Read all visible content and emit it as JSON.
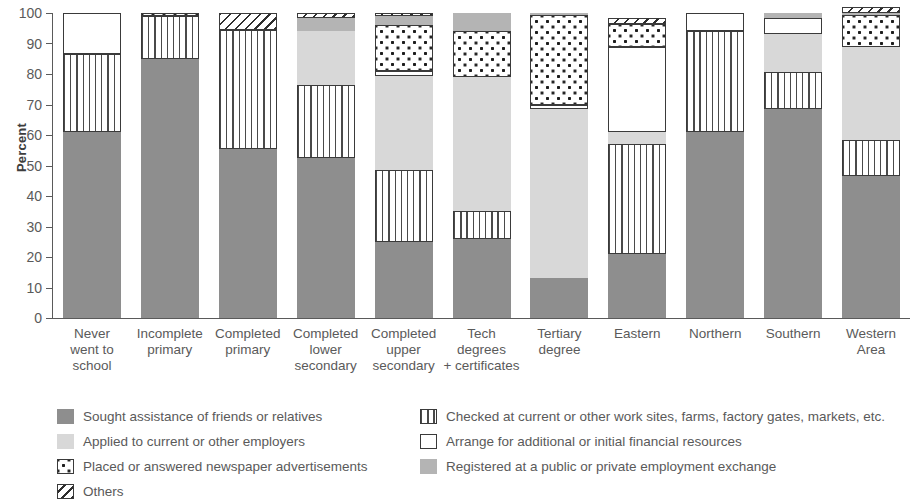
{
  "chart_data": {
    "type": "bar",
    "subtype": "stacked-bar-100",
    "title": "",
    "xlabel": "",
    "ylabel": "Percent",
    "ylim": [
      0,
      100
    ],
    "yticks": [
      0,
      10,
      20,
      30,
      40,
      50,
      60,
      70,
      80,
      90,
      100
    ],
    "grid": false,
    "legend_position": "bottom",
    "categories": [
      "Never\nwent to\nschool",
      "Incomplete\nprimary",
      "Completed\nprimary",
      "Completed\nlower\nsecondary",
      "Completed\nupper\nsecondary",
      "Tech\ndegrees\n+ certificates",
      "Tertiary\ndegree",
      "Eastern",
      "Northern",
      "Southern",
      "Western\nArea"
    ],
    "series": [
      {
        "name": "Sought assistance of friends or relatives",
        "key": "sought",
        "color": "#8e8e8e",
        "pattern": "solid-gray",
        "values": [
          61,
          85,
          55.5,
          52.5,
          25,
          26,
          13,
          21,
          61,
          68.5,
          46.5
        ]
      },
      {
        "name": "Checked at current or other work sites, farms, factory gates, markets, etc.",
        "key": "checked",
        "color": "#ffffff",
        "pattern": "vertical-stripes",
        "values": [
          25.5,
          14,
          39,
          24,
          23.5,
          9,
          0,
          36,
          33,
          12,
          12
        ]
      },
      {
        "name": "Applied to current or other employers",
        "key": "applied",
        "color": "#d8d8d8",
        "pattern": "light-gray",
        "values": [
          0,
          0,
          0,
          17.5,
          31,
          44,
          55.5,
          4,
          0,
          12.5,
          30.5
        ]
      },
      {
        "name": "Arrange for additional or initial financial resources",
        "key": "arrange",
        "color": "#ffffff",
        "pattern": "white",
        "values": [
          13.5,
          0,
          0,
          0,
          1.5,
          0,
          1.5,
          28,
          6,
          5.5,
          0
        ]
      },
      {
        "name": "Placed or answered newspaper advertisements",
        "key": "placed",
        "color": "#ffffff",
        "pattern": "dots",
        "values": [
          0,
          1,
          0,
          0,
          15,
          15,
          29.5,
          7.5,
          0,
          0,
          10.5
        ]
      },
      {
        "name": "Registered at a public or private employment exchange",
        "key": "registered",
        "color": "#b4b4b4",
        "pattern": "faint-gray",
        "values": [
          0,
          0,
          0,
          4.5,
          3,
          6,
          0.5,
          0,
          0,
          1.5,
          0.5
        ]
      },
      {
        "name": "Others",
        "key": "others",
        "color": "#ffffff",
        "pattern": "diagonal-hatch",
        "values": [
          0,
          0,
          5.5,
          1.5,
          1,
          0,
          0,
          2,
          0,
          0,
          2
        ]
      }
    ],
    "stack_order": [
      "sought",
      "checked",
      "applied",
      "arrange",
      "placed",
      "registered",
      "others"
    ]
  },
  "legend": {
    "left": [
      {
        "label": "Sought assistance of friends or relatives",
        "pattern": "solid-gray"
      },
      {
        "label": "Applied to current or other employers",
        "pattern": "light-gray"
      },
      {
        "label": "Placed or answered newspaper advertisements",
        "pattern": "dots"
      },
      {
        "label": "Others",
        "pattern": "diagonal-hatch"
      }
    ],
    "right": [
      {
        "label": "Checked at current or other work sites, farms, factory gates, markets, etc.",
        "pattern": "vertical-stripes"
      },
      {
        "label": "Arrange for additional or initial financial resources",
        "pattern": "white"
      },
      {
        "label": "Registered at a public or private employment exchange",
        "pattern": "faint-gray"
      }
    ]
  }
}
